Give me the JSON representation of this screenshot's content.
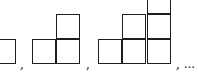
{
  "figure": {
    "stroke_color": "#1e1e1e",
    "background": "#ffffff",
    "separators": [
      ",",
      ",",
      ", ..."
    ],
    "figures": [
      {
        "index": 1,
        "cells": [
          {
            "col": 0,
            "row": 0
          }
        ]
      },
      {
        "index": 2,
        "cells": [
          {
            "col": 0,
            "row": 0
          },
          {
            "col": 1,
            "row": 0
          },
          {
            "col": 1,
            "row": 1
          }
        ]
      },
      {
        "index": 3,
        "cells": [
          {
            "col": 0,
            "row": 0
          },
          {
            "col": 1,
            "row": 0
          },
          {
            "col": 2,
            "row": 0
          },
          {
            "col": 1,
            "row": 1
          },
          {
            "col": 2,
            "row": 1
          },
          {
            "col": 2,
            "row": 2
          }
        ]
      }
    ]
  }
}
